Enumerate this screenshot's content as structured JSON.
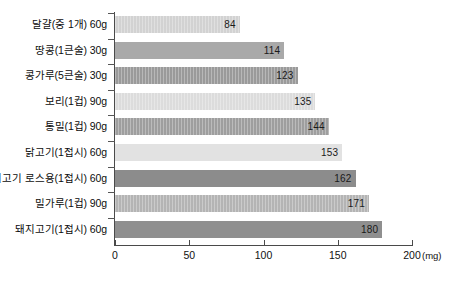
{
  "chart_data": {
    "type": "bar",
    "orientation": "horizontal",
    "title": "",
    "xlabel": "(mg)",
    "ylabel": "",
    "unit": "(mg)",
    "xlim": [
      0,
      200
    ],
    "xticks": [
      0,
      50,
      100,
      150,
      200
    ],
    "xtick_labels": [
      "0",
      "50",
      "100",
      "150",
      "200"
    ],
    "grid": false,
    "legend": false,
    "categories": [
      "달걀(중 1개) 60g",
      "땅콩(1큰술) 30g",
      "콩가루(5큰술) 30g",
      "보리(1컵) 90g",
      "통밀(1컵) 90g",
      "닭고기(1접시) 60g",
      "쇠고기 로스용(1접시) 60g",
      "밀가루(1컵) 90g",
      "돼지고기(1접시) 60g"
    ],
    "values": [
      84,
      114,
      123,
      135,
      144,
      153,
      162,
      171,
      180
    ],
    "value_labels": [
      "84",
      "114",
      "123",
      "135",
      "144",
      "153",
      "162",
      "171",
      "180"
    ],
    "bar_colors": [
      "#d2d2d2",
      "#a9a9a9",
      "#9a9a9a",
      "#dcdcdc",
      "#9e9e9e",
      "#e2e2e2",
      "#8c8c8c",
      "#b4b4b4",
      "#8f8f8f"
    ],
    "bar_textured": [
      true,
      false,
      true,
      true,
      true,
      false,
      false,
      true,
      false
    ]
  }
}
